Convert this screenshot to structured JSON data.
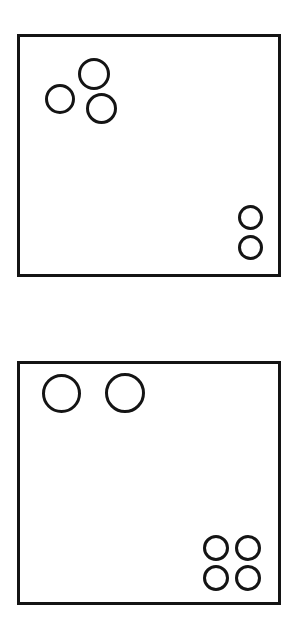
{
  "page": {
    "background_color": "#ffffff",
    "width": 302,
    "height": 639
  },
  "style": {
    "stroke_color": "#141414",
    "fill_color": "transparent",
    "panel_border_width": 3,
    "circle_border_width": 3
  },
  "panels": [
    {
      "id": "panel-top",
      "label": "Top panel",
      "x": 17,
      "y": 34,
      "width": 264,
      "height": 243,
      "total_circles": 5,
      "groups": [
        {
          "id": "cluster-top-left",
          "label": "Upper-left cluster",
          "count": 3,
          "size": "medium",
          "circles": [
            {
              "name": "circle-top",
              "cx": 94,
              "cy": 74,
              "d": 32
            },
            {
              "name": "circle-left",
              "cx": 60,
              "cy": 99,
              "d": 30
            },
            {
              "name": "circle-lower-right",
              "cx": 101,
              "cy": 108,
              "d": 31
            }
          ]
        },
        {
          "id": "cluster-bottom-right",
          "label": "Lower-right cluster",
          "count": 2,
          "size": "small",
          "circles": [
            {
              "name": "circle-upper",
              "cx": 250,
              "cy": 217,
              "d": 25
            },
            {
              "name": "circle-lower",
              "cx": 250,
              "cy": 247,
              "d": 25
            }
          ]
        }
      ]
    },
    {
      "id": "panel-bottom",
      "label": "Bottom panel",
      "x": 17,
      "y": 361,
      "width": 264,
      "height": 244,
      "total_circles": 6,
      "groups": [
        {
          "id": "cluster-top-left",
          "label": "Upper-left pair",
          "count": 2,
          "size": "large",
          "circles": [
            {
              "name": "circle-left",
              "cx": 61,
              "cy": 393,
              "d": 39
            },
            {
              "name": "circle-right",
              "cx": 125,
              "cy": 393,
              "d": 40
            }
          ]
        },
        {
          "id": "cluster-bottom-right",
          "label": "Lower-right grid",
          "count": 4,
          "size": "small",
          "circles": [
            {
              "name": "circle-top-left",
              "cx": 216,
              "cy": 548,
              "d": 26
            },
            {
              "name": "circle-top-right",
              "cx": 248,
              "cy": 548,
              "d": 26
            },
            {
              "name": "circle-bottom-left",
              "cx": 216,
              "cy": 578,
              "d": 26
            },
            {
              "name": "circle-bottom-right",
              "cx": 248,
              "cy": 578,
              "d": 26
            }
          ]
        }
      ]
    }
  ]
}
